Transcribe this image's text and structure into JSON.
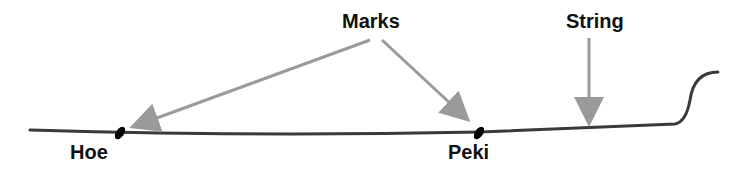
{
  "labels": {
    "marks": "Marks",
    "string": "String",
    "hoe": "Hoe",
    "peki": "Peki"
  },
  "colors": {
    "string_line": "#3a3a3a",
    "arrow": "#9a9a9a",
    "mark": "#000000",
    "text": "#111111"
  }
}
